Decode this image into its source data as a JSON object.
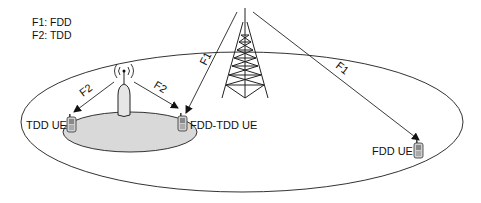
{
  "legend": {
    "items": [
      {
        "label": "F1: FDD"
      },
      {
        "label": "F2: TDD"
      }
    ]
  },
  "nodes": {
    "macro_tower": {
      "label": "Macro cell tower (FDD)"
    },
    "small_cell": {
      "label": "Small cell (TDD)"
    },
    "tdd_ue": {
      "label": "TDD UE"
    },
    "fdd_tdd_ue": {
      "label": "FDD-TDD UE"
    },
    "fdd_ue": {
      "label": "FDD UE"
    }
  },
  "links": [
    {
      "from": "macro_tower",
      "to": "fdd_tdd_ue",
      "label": "F1"
    },
    {
      "from": "macro_tower",
      "to": "fdd_ue",
      "label": "F1"
    },
    {
      "from": "small_cell",
      "to": "tdd_ue",
      "label": "F2"
    },
    {
      "from": "small_cell",
      "to": "fdd_tdd_ue",
      "label": "F2"
    }
  ],
  "colors": {
    "line": "#333333",
    "small_cell_area": "#d9d9d9",
    "background": "#ffffff"
  }
}
